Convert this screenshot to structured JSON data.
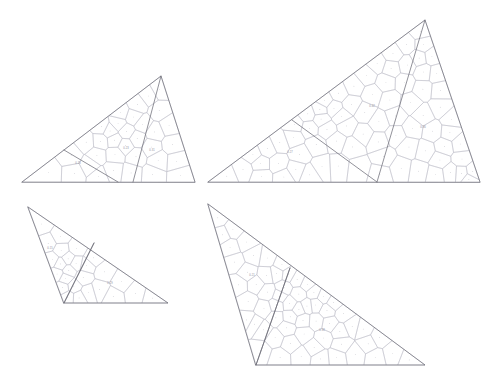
{
  "figure": {
    "background_color": "#ffffff",
    "outline_color": "#6e6e78",
    "mesh_color": "#bdbdc6",
    "node_color": "#9a9aa6",
    "label_color": "#8d8d99",
    "width": 503,
    "height": 381,
    "panel_count": 4
  },
  "panels": [
    {
      "id": "panel-top-left",
      "name": "top-left-triangle",
      "label": "",
      "vertices": [
        [
          22,
          182
        ],
        [
          161,
          76
        ],
        [
          195,
          182
        ]
      ],
      "partition": [
        [
          64,
          150
        ],
        [
          118,
          182
        ]
      ],
      "partition_alt": [
        [
          161,
          76
        ],
        [
          133,
          182
        ]
      ],
      "mesh_seed": 11,
      "mesh_density": 34,
      "cell_labels": [
        {
          "text": "0.23",
          "x": 126,
          "y": 148
        },
        {
          "text": "0.18",
          "x": 78,
          "y": 163
        },
        {
          "text": "0.31",
          "x": 152,
          "y": 150
        }
      ]
    },
    {
      "id": "panel-top-right",
      "name": "top-right-triangle",
      "label": "",
      "vertices": [
        [
          208,
          182
        ],
        [
          425,
          20
        ],
        [
          480,
          182
        ]
      ],
      "partition": [
        [
          292,
          120
        ],
        [
          377,
          182
        ]
      ],
      "partition_alt": [
        [
          425,
          20
        ],
        [
          377,
          182
        ]
      ],
      "mesh_seed": 27,
      "mesh_density": 78,
      "cell_labels": [
        {
          "text": "0.42",
          "x": 372,
          "y": 106
        },
        {
          "text": "0.27",
          "x": 290,
          "y": 152
        },
        {
          "text": "0.36",
          "x": 423,
          "y": 127
        }
      ]
    },
    {
      "id": "panel-bottom-left",
      "name": "bottom-left-triangle",
      "label": "",
      "vertices": [
        [
          28,
          207
        ],
        [
          168,
          303
        ],
        [
          64,
          303
        ]
      ],
      "partition": [
        [
          64,
          303
        ],
        [
          94,
          243
        ]
      ],
      "partition_alt": [
        [
          64,
          303
        ],
        [
          94,
          243
        ]
      ],
      "mesh_seed": 41,
      "mesh_density": 26,
      "cell_labels": [
        {
          "text": "0.15",
          "x": 50,
          "y": 248
        },
        {
          "text": "0.29",
          "x": 110,
          "y": 283
        }
      ]
    },
    {
      "id": "panel-bottom-right",
      "name": "bottom-right-triangle",
      "label": "",
      "vertices": [
        [
          208,
          204
        ],
        [
          425,
          365
        ],
        [
          256,
          365
        ]
      ],
      "partition": [
        [
          256,
          365
        ],
        [
          290,
          268
        ]
      ],
      "partition_alt": [
        [
          256,
          365
        ],
        [
          290,
          268
        ]
      ],
      "mesh_seed": 59,
      "mesh_density": 62,
      "cell_labels": [
        {
          "text": "0.21",
          "x": 252,
          "y": 275
        },
        {
          "text": "0.38",
          "x": 322,
          "y": 330
        }
      ]
    }
  ]
}
